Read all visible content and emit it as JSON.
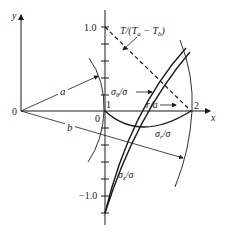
{
  "figure": {
    "type": "thermal-stress-diagram",
    "axes": {
      "x_label": "x",
      "y_label": "y",
      "origin_label": "0"
    },
    "radii": {
      "inner_label": "a",
      "outer_label": "b"
    },
    "stress_axis": {
      "top_tick_label": "1.0",
      "bottom_tick_label": "−1.0",
      "zero_label": "0"
    },
    "r_axis": {
      "start_label": "1",
      "end_label": "2",
      "variable_label": "r/a"
    },
    "curves": [
      {
        "name": "temperature",
        "label_main": "T/(T",
        "label_sub1": "a",
        "label_mid": " − T",
        "label_sub2": "b",
        "label_end": ")",
        "style": "dashed"
      },
      {
        "name": "sigma-theta",
        "label_main": "σ",
        "label_sub": "θ",
        "label_end": "/σ",
        "style": "solid"
      },
      {
        "name": "sigma-r",
        "label_main": "σ",
        "label_sub": "r",
        "label_end": "/σ",
        "style": "solid"
      },
      {
        "name": "sigma-z",
        "label_main": "σ",
        "label_sub": "z",
        "label_end": "/σ",
        "style": "solid"
      }
    ]
  }
}
